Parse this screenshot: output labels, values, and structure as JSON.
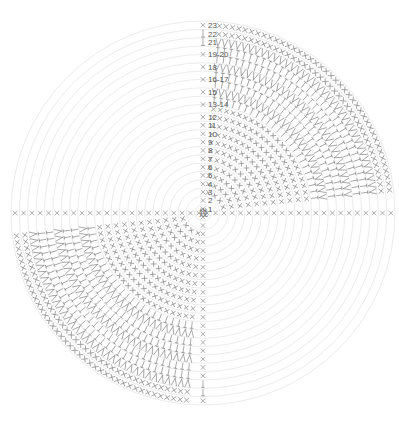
{
  "diagram": {
    "title": "",
    "type": "crochet-round-chart",
    "center": {
      "x": 203,
      "y": 213
    },
    "center_symbol": "magic-ring",
    "center_glyph": "幾",
    "ring_count": 23,
    "outer_radius": 192,
    "colors": {
      "rings": "#ececec",
      "stitches": "#8a8a8a",
      "labels": "#555555",
      "background": "#ffffff"
    },
    "row_labels": [
      {
        "text": "1",
        "row": 1
      },
      {
        "text": "2",
        "row": 2
      },
      {
        "text": "3",
        "row": 3
      },
      {
        "text": "4",
        "row": 4
      },
      {
        "text": "5",
        "row": 5
      },
      {
        "text": "6",
        "row": 6
      },
      {
        "text": "7",
        "row": 7
      },
      {
        "text": "8",
        "row": 8
      },
      {
        "text": "9",
        "row": 9
      },
      {
        "text": "10",
        "row": 10
      },
      {
        "text": "11",
        "row": 11
      },
      {
        "text": "12",
        "row": 12
      },
      {
        "text": "13-14",
        "row": 13.5
      },
      {
        "text": "15",
        "row": 15
      },
      {
        "text": "16-17",
        "row": 16.5
      },
      {
        "text": "18",
        "row": 18
      },
      {
        "text": "19-20",
        "row": 19.5
      },
      {
        "text": "21",
        "row": 21
      },
      {
        "text": "22",
        "row": 22
      },
      {
        "text": "23",
        "row": 23
      }
    ],
    "legend_symbols": {
      "x": "single crochet",
      "T": "half double crochet",
      "V": "increase"
    },
    "wedges": [
      {
        "name": "top-right",
        "start_deg": -86,
        "end_deg": -6,
        "filled_from_row": 3
      },
      {
        "name": "bottom-left",
        "start_deg": 94,
        "end_deg": 174,
        "filled_from_row": 3
      }
    ],
    "spokes": [
      {
        "name": "up",
        "deg": -90
      },
      {
        "name": "down",
        "deg": 90
      },
      {
        "name": "left",
        "deg": 180
      },
      {
        "name": "right",
        "deg": 0
      }
    ]
  }
}
